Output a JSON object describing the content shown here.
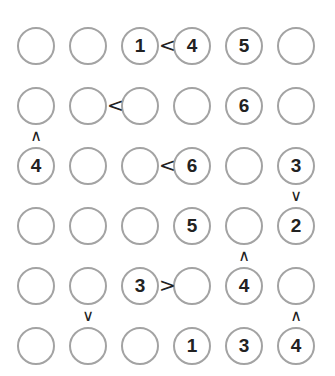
{
  "puzzle": {
    "type": "futoshiki",
    "size": 6,
    "colors": {
      "circle_stroke": "#a3a3a3",
      "digit": "#222222",
      "sign": "#222222",
      "background": "#ffffff"
    },
    "grid": [
      [
        "",
        "",
        "1",
        "4",
        "5",
        ""
      ],
      [
        "",
        "",
        "",
        "",
        "6",
        ""
      ],
      [
        "4",
        "",
        "",
        "6",
        "",
        "3"
      ],
      [
        "",
        "",
        "",
        "5",
        "",
        "2"
      ],
      [
        "",
        "",
        "3",
        "",
        "4",
        ""
      ],
      [
        "",
        "",
        "",
        "1",
        "3",
        "4"
      ]
    ],
    "horizontal_constraints": [
      {
        "row": 0,
        "left_col": 2,
        "symbol": "<"
      },
      {
        "row": 1,
        "left_col": 1,
        "symbol": "<"
      },
      {
        "row": 2,
        "left_col": 2,
        "symbol": "<"
      },
      {
        "row": 4,
        "left_col": 2,
        "symbol": ">"
      }
    ],
    "vertical_constraints": [
      {
        "top_row": 1,
        "col": 0,
        "symbol": "^"
      },
      {
        "top_row": 2,
        "col": 5,
        "symbol": "v"
      },
      {
        "top_row": 3,
        "col": 4,
        "symbol": "^"
      },
      {
        "top_row": 4,
        "col": 1,
        "symbol": "v"
      },
      {
        "top_row": 4,
        "col": 5,
        "symbol": "^"
      }
    ],
    "layout": {
      "col_centers": [
        36,
        88,
        140,
        192,
        244,
        296
      ],
      "row_centers": [
        46,
        106,
        166,
        226,
        286,
        346
      ]
    }
  }
}
